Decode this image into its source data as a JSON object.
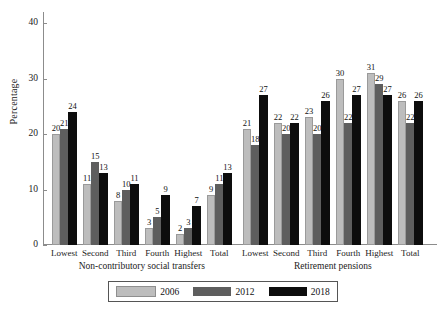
{
  "axis": {
    "ylabel": "Percentage",
    "yticks": [
      "0",
      "10",
      "20",
      "30",
      "40"
    ]
  },
  "legend": {
    "entries": [
      {
        "label": "2006",
        "color": "#bdbdbd"
      },
      {
        "label": "2012",
        "color": "#5e5e5e"
      },
      {
        "label": "2018",
        "color": "#0d0d0d"
      }
    ]
  },
  "panels": [
    {
      "title": "Non-contributory social transfers"
    },
    {
      "title": "Retirement pensions"
    }
  ],
  "chart_data": {
    "type": "bar",
    "title": "",
    "xlabel": "",
    "ylabel": "Percentage",
    "ylim": [
      0,
      42
    ],
    "yticks": [
      0,
      10,
      20,
      30,
      40
    ],
    "grid": false,
    "legend_position": "bottom",
    "series_names": [
      "2006",
      "2012",
      "2018"
    ],
    "panels": [
      {
        "name": "Non-contributory social transfers",
        "categories": [
          "Lowest",
          "Second",
          "Third",
          "Fourth",
          "Highest",
          "Total"
        ],
        "series": [
          {
            "name": "2006",
            "values": [
              20,
              11,
              8,
              3,
              2,
              9
            ]
          },
          {
            "name": "2012",
            "values": [
              21,
              15,
              10,
              5,
              3,
              11
            ]
          },
          {
            "name": "2018",
            "values": [
              24,
              13,
              11,
              9,
              7,
              13
            ]
          }
        ]
      },
      {
        "name": "Retirement pensions",
        "categories": [
          "Lowest",
          "Second",
          "Third",
          "Fourth",
          "Highest",
          "Total"
        ],
        "series": [
          {
            "name": "2006",
            "values": [
              21,
              22,
              23,
              30,
              31,
              26
            ]
          },
          {
            "name": "2012",
            "values": [
              18,
              20,
              20,
              22,
              29,
              22
            ]
          },
          {
            "name": "2018",
            "values": [
              27,
              22,
              26,
              27,
              27,
              26
            ]
          }
        ]
      }
    ]
  }
}
